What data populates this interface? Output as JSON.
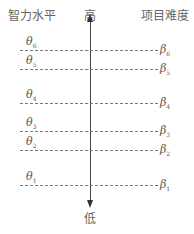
{
  "header": {
    "left": "智力水平",
    "center": "高",
    "right": "项目难度"
  },
  "axis": {
    "top_label": "高",
    "bottom_label": "低"
  },
  "levels": [
    {
      "theta": "θ",
      "theta_sub": "6",
      "beta": "β",
      "beta_sub": "6",
      "y": 50
    },
    {
      "theta": "θ",
      "theta_sub": "5",
      "beta": "β",
      "beta_sub": "5",
      "y": 69
    },
    {
      "theta": "θ",
      "theta_sub": "4",
      "beta": "β",
      "beta_sub": "4",
      "y": 103
    },
    {
      "theta": "θ",
      "theta_sub": "3",
      "beta": "β",
      "beta_sub": "3",
      "y": 131
    },
    {
      "theta": "θ",
      "theta_sub": "2",
      "beta": "β",
      "beta_sub": "2",
      "y": 150
    },
    {
      "theta": "θ",
      "theta_sub": "1",
      "beta": "β",
      "beta_sub": "1",
      "y": 185
    }
  ]
}
